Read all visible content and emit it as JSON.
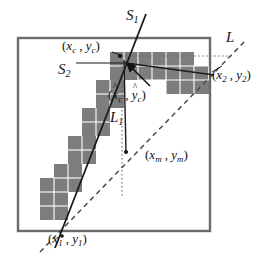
{
  "figure": {
    "name": "line-segment-estimation-diagram",
    "colors": {
      "frame": "#6b6b6b",
      "block_fill": "#7d7d7d",
      "block_grid": "#ffffff",
      "solid_line": "#1a1a1a",
      "dashed_line": "#4a4a4a",
      "dotted_line": "#6a6a6a",
      "text": "#111111",
      "background": "#ffffff"
    },
    "labels": {
      "s1": {
        "text": "S",
        "sub": "1"
      },
      "s2": {
        "text": "S",
        "sub": "2"
      },
      "l": {
        "text": "L"
      },
      "l1": {
        "text": "L",
        "sub": "1"
      },
      "center_true": {
        "open": "(",
        "x": "x",
        "x_sub": "c",
        "comma": " , ",
        "y": "y",
        "y_sub": "c",
        "close": ")"
      },
      "center_est": {
        "open": "(",
        "x": "x",
        "x_sub": "c",
        "comma": " , ",
        "y": "y",
        "y_sub": "c",
        "close": ")",
        "hat": "^"
      },
      "point2": {
        "open": "(",
        "x": "x",
        "x_sub": "2",
        "comma": " , ",
        "y": "y",
        "y_sub": "2",
        "close": ")"
      },
      "point_m": {
        "open": "(",
        "x": "x",
        "x_sub": "m",
        "comma": " , ",
        "y": "y",
        "y_sub": "m",
        "close": ")"
      },
      "point1": {
        "open": "(",
        "x": "x",
        "x_sub": "1",
        "comma": " , ",
        "y": "y",
        "y_sub": "1",
        "close": ")"
      }
    },
    "geometry": {
      "frame": {
        "x": 18,
        "y": 38,
        "width": 192,
        "height": 193
      },
      "points": {
        "corner": {
          "x": 120,
          "y": 56
        },
        "p1": {
          "x": 62,
          "y": 236
        },
        "p2": {
          "x": 212,
          "y": 82
        },
        "pm": {
          "x": 126,
          "y": 152
        },
        "center_est": {
          "x": 128,
          "y": 62
        }
      },
      "cell_size": 14,
      "blocks": [
        {
          "col": 0,
          "row": 11
        },
        {
          "col": 1,
          "row": 11
        },
        {
          "col": 0,
          "row": 12
        },
        {
          "col": 1,
          "row": 12
        },
        {
          "col": 0,
          "row": 13
        },
        {
          "col": 1,
          "row": 13
        },
        {
          "col": 1,
          "row": 10
        },
        {
          "col": 2,
          "row": 10
        },
        {
          "col": 1,
          "row": 9
        },
        {
          "col": 2,
          "row": 9
        },
        {
          "col": 2,
          "row": 8
        },
        {
          "col": 3,
          "row": 8
        },
        {
          "col": 2,
          "row": 7
        },
        {
          "col": 3,
          "row": 7
        },
        {
          "col": 3,
          "row": 6
        },
        {
          "col": 4,
          "row": 6
        },
        {
          "col": 3,
          "row": 5
        },
        {
          "col": 4,
          "row": 5
        },
        {
          "col": 4,
          "row": 4
        },
        {
          "col": 5,
          "row": 4
        },
        {
          "col": 4,
          "row": 3
        },
        {
          "col": 5,
          "row": 3
        },
        {
          "col": 5,
          "row": 2
        },
        {
          "col": 6,
          "row": 2
        },
        {
          "col": 5,
          "row": 1
        },
        {
          "col": 6,
          "row": 1
        },
        {
          "col": 7,
          "row": 1
        },
        {
          "col": 8,
          "row": 1
        },
        {
          "col": 9,
          "row": 1
        },
        {
          "col": 10,
          "row": 1
        },
        {
          "col": 7,
          "row": 2
        },
        {
          "col": 8,
          "row": 2
        },
        {
          "col": 9,
          "row": 2
        },
        {
          "col": 10,
          "row": 2
        },
        {
          "col": 11,
          "row": 2
        },
        {
          "col": 12,
          "row": 2
        },
        {
          "col": 11,
          "row": 3
        },
        {
          "col": 12,
          "row": 3
        },
        {
          "col": 13,
          "row": 3
        }
      ]
    }
  }
}
